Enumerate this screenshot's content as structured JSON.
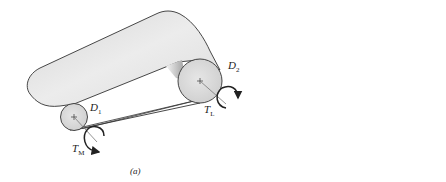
{
  "figure_a": {
    "caption": "(a)",
    "labels": {
      "d1": {
        "main": "D",
        "sub": "1"
      },
      "d2": {
        "main": "D",
        "sub": "2"
      },
      "tl": {
        "main": "T",
        "sub": "L"
      },
      "tm": {
        "main": "T",
        "sub": "M"
      }
    }
  },
  "figure_b": {
    "caption": "(b)",
    "labels": {
      "f1": {
        "main": "F",
        "sub": "1"
      },
      "f2": {
        "main": "F",
        "sub": "2"
      },
      "d1": {
        "main": "D",
        "sub": "1"
      },
      "tm": {
        "main": "T",
        "sub": "M"
      }
    }
  },
  "colors": {
    "stroke": "#333333",
    "belt_fill": "#e4e4e4",
    "roller_fill": "#d8d8d8"
  }
}
